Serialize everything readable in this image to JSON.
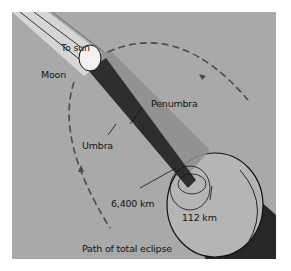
{
  "diagram": {
    "labels": {
      "to_sun": "To sun",
      "moon": "Moon",
      "penumbra": "Penumbra",
      "umbra": "Umbra",
      "earth_radius": "6,400 km",
      "umbra_width": "112 km",
      "path": "Path of total eclipse"
    },
    "colors": {
      "background": "#a9a9a9",
      "sunbeam": "#d8d8d8",
      "umbra": "#2e2e2e",
      "penumbra": "#8c8c8c",
      "earth": "#b4b4b4",
      "earth_shadow": "#262626",
      "orbit": "#4a4a4a"
    }
  }
}
